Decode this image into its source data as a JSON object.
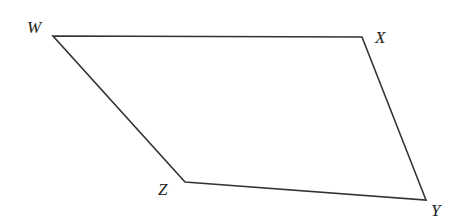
{
  "figure": {
    "shape": "quadrilateral",
    "vertices": [
      {
        "name": "W",
        "x": 53,
        "y": 36,
        "label_x": 27,
        "label_y": 33
      },
      {
        "name": "X",
        "x": 362,
        "y": 37,
        "label_x": 375,
        "label_y": 43
      },
      {
        "name": "Y",
        "x": 426,
        "y": 200,
        "label_x": 431,
        "label_y": 216
      },
      {
        "name": "Z",
        "x": 185,
        "y": 182,
        "label_x": 158,
        "label_y": 195
      }
    ],
    "stroke_color": "#333333"
  }
}
